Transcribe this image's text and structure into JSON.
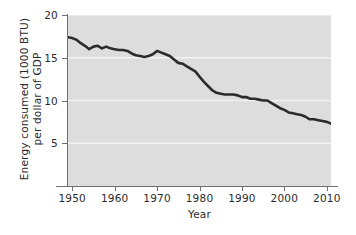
{
  "chart_data": {
    "type": "line",
    "title": "",
    "xlabel": "Year",
    "ylabel": "Energy consumed (1000 BTU)\nper dollar of GDP",
    "xlim": [
      1949,
      2011
    ],
    "ylim": [
      0,
      20
    ],
    "xticks": [
      1950,
      1960,
      1970,
      1980,
      1990,
      2000,
      2010
    ],
    "xtick_labels": [
      "1950",
      "1960",
      "1970",
      "1980",
      "1990",
      "2000",
      "2010"
    ],
    "yticks": [
      5,
      10,
      15,
      20
    ],
    "ytick_labels": [
      "5",
      "10",
      "15",
      "20"
    ],
    "grid": "horizontal-white",
    "legend": "none",
    "plot_background": "#dddddd",
    "line_color": "#2b2b2b",
    "line_width": 2.6,
    "series": [
      {
        "name": "Energy intensity",
        "x": [
          1949,
          1950,
          1951,
          1952,
          1953,
          1954,
          1955,
          1956,
          1957,
          1958,
          1959,
          1960,
          1961,
          1962,
          1963,
          1964,
          1965,
          1966,
          1967,
          1968,
          1969,
          1970,
          1971,
          1972,
          1973,
          1974,
          1975,
          1976,
          1977,
          1978,
          1979,
          1980,
          1981,
          1982,
          1983,
          1984,
          1985,
          1986,
          1987,
          1988,
          1989,
          1990,
          1991,
          1992,
          1993,
          1994,
          1995,
          1996,
          1997,
          1998,
          1999,
          2000,
          2001,
          2002,
          2003,
          2004,
          2005,
          2006,
          2007,
          2008,
          2009,
          2010,
          2011
        ],
        "y": [
          17.4,
          17.3,
          17.1,
          16.7,
          16.4,
          16.0,
          16.3,
          16.4,
          16.1,
          16.3,
          16.1,
          16.0,
          15.9,
          15.9,
          15.8,
          15.5,
          15.3,
          15.2,
          15.1,
          15.2,
          15.4,
          15.8,
          15.6,
          15.4,
          15.2,
          14.8,
          14.4,
          14.3,
          14.0,
          13.7,
          13.4,
          12.8,
          12.2,
          11.7,
          11.2,
          10.9,
          10.8,
          10.7,
          10.7,
          10.7,
          10.6,
          10.4,
          10.4,
          10.2,
          10.2,
          10.1,
          10.0,
          10.0,
          9.7,
          9.4,
          9.1,
          8.9,
          8.6,
          8.5,
          8.4,
          8.3,
          8.1,
          7.8,
          7.8,
          7.7,
          7.6,
          7.5,
          7.3
        ]
      }
    ]
  },
  "axes": {
    "x_title": "Year",
    "y_title": "Energy consumed (1000 BTU)\nper dollar of GDP"
  }
}
